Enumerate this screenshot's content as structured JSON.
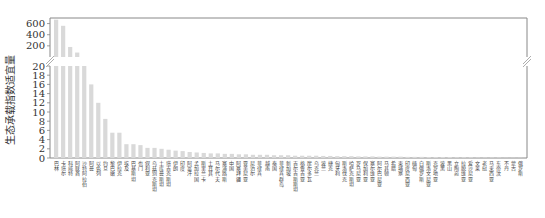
{
  "chart_data": {
    "type": "bar",
    "title": "",
    "xlabel": "",
    "ylabel": "生态承载指数适宜量",
    "broken_axis": true,
    "lower_ylim": [
      0,
      20
    ],
    "upper_ylim": [
      0,
      700
    ],
    "lower_yticks": [
      0,
      2,
      4,
      6,
      8,
      10,
      12,
      14,
      16,
      18,
      20
    ],
    "upper_yticks": [
      200,
      400,
      600
    ],
    "bar_color": "#d9d9d9",
    "grid": false,
    "legend": null,
    "categories": [
      "巴林",
      "卡塔尔",
      "科威特",
      "阿联酋",
      "沙特阿拉伯",
      "阿曼",
      "以色列",
      "约旦",
      "黎巴嫩",
      "伊拉克",
      "埃及",
      "巴基斯坦",
      "也门",
      "叙利亚",
      "乌兹别克斯坦",
      "土库曼斯坦",
      "塔吉克斯坦",
      "伊朗",
      "印度",
      "阿富汗",
      "孟加拉国",
      "斯里兰卡",
      "土耳其",
      "马尔代夫",
      "塞浦路斯",
      "中国",
      "阿塞拜疆",
      "亚美尼亚",
      "尼泊尔",
      "菲律宾",
      "越南",
      "泰国",
      "菲律宾群岛",
      "新加坡",
      "吉尔吉斯斯坦",
      "格鲁吉亚",
      "摩尔多瓦",
      "乌克兰",
      "波兰",
      "捷克",
      "匈牙利",
      "斯洛伐克",
      "哈萨克斯坦",
      "罗马尼亚",
      "保加利亚",
      "塞尔维亚",
      "阿尔巴尼亚",
      "马其顿",
      "希腊",
      "柬埔寨",
      "印度尼西亚",
      "缅甸",
      "白俄罗斯",
      "斯洛文尼亚",
      "克罗地亚",
      "波黑",
      "黑山",
      "立陶宛",
      "拉脱维亚",
      "爱沙尼亚",
      "文莱",
      "老挝",
      "马来西亚",
      "东帝汶",
      "不丹",
      "蒙古",
      "俄罗斯"
    ],
    "values": [
      670,
      560,
      180,
      80,
      20,
      16,
      12,
      8.5,
      5.5,
      5.5,
      3,
      3,
      2.8,
      2.2,
      2.2,
      2,
      1.8,
      1.6,
      1.5,
      1.3,
      1.2,
      1.1,
      1.0,
      1.0,
      0.9,
      0.9,
      0.8,
      0.8,
      0.7,
      0.7,
      0.7,
      0.6,
      0.6,
      0.6,
      0.5,
      0.5,
      0.5,
      0.5,
      0.45,
      0.45,
      0.4,
      0.4,
      0.4,
      0.35,
      0.35,
      0.35,
      0.3,
      0.3,
      0.3,
      0.3,
      0.25,
      0.25,
      0.25,
      0.2,
      0.2,
      0.2,
      0.2,
      0.15,
      0.15,
      0.15,
      0.1,
      0.1,
      0.1,
      0.1,
      0.05,
      0.05,
      0.05
    ]
  }
}
